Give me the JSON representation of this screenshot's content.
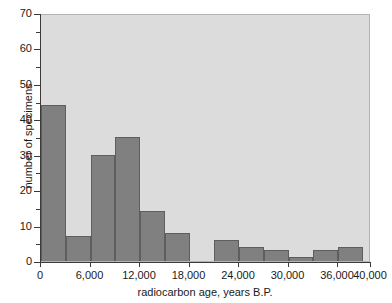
{
  "chart_data": {
    "type": "bar",
    "title": "",
    "subtitle": "",
    "xlabel": "radiocarbon age, years B.P.",
    "ylabel": "number of specimens",
    "xlim": [
      0,
      40000
    ],
    "ylim": [
      0,
      70
    ],
    "bin_width": 3000,
    "grid": false,
    "legend": null,
    "plot_background": "#dcdcdc",
    "bar_color": "#808080",
    "bar_edge_color": "#5e5e5e",
    "x_tick_labels": [
      "0",
      "6,000",
      "12,000",
      "18,000",
      "24,000",
      "30,000",
      "36,000",
      "40,000"
    ],
    "x_tick_values": [
      0,
      6000,
      12000,
      18000,
      24000,
      30000,
      36000,
      40000
    ],
    "y_tick_labels": [
      "0",
      "10",
      "20",
      "30",
      "40",
      "50",
      "60",
      "70"
    ],
    "y_tick_values": [
      0,
      10,
      20,
      30,
      40,
      50,
      60,
      70
    ],
    "y_minor_tick_values": [
      5,
      15,
      25,
      35,
      45,
      55,
      65
    ],
    "categories": [
      "0-3,000",
      "3,000-6,000",
      "6,000-9,000",
      "9,000-12,000",
      "12,000-15,000",
      "15,000-18,000",
      "18,000-21,000",
      "21,000-24,000",
      "24,000-27,000",
      "27,000-30,000",
      "30,000-33,000",
      "33,000-36,000",
      "36,000-39,000",
      "39,000-40,000"
    ],
    "bins": [
      {
        "start": 0,
        "end": 3000,
        "value": 44
      },
      {
        "start": 3000,
        "end": 6000,
        "value": 7
      },
      {
        "start": 6000,
        "end": 9000,
        "value": 30
      },
      {
        "start": 9000,
        "end": 12000,
        "value": 35
      },
      {
        "start": 12000,
        "end": 15000,
        "value": 14
      },
      {
        "start": 15000,
        "end": 18000,
        "value": 8
      },
      {
        "start": 18000,
        "end": 21000,
        "value": 0
      },
      {
        "start": 21000,
        "end": 24000,
        "value": 6
      },
      {
        "start": 24000,
        "end": 27000,
        "value": 4
      },
      {
        "start": 27000,
        "end": 30000,
        "value": 3
      },
      {
        "start": 30000,
        "end": 33000,
        "value": 1
      },
      {
        "start": 33000,
        "end": 36000,
        "value": 3
      },
      {
        "start": 36000,
        "end": 39000,
        "value": 4
      },
      {
        "start": 39000,
        "end": 40000,
        "value": 0
      }
    ],
    "values": [
      44,
      7,
      30,
      35,
      14,
      8,
      0,
      6,
      4,
      3,
      1,
      3,
      4,
      0
    ]
  }
}
